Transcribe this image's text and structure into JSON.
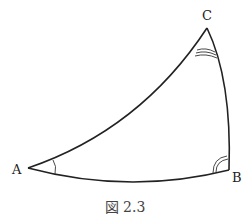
{
  "figure": {
    "caption": "図 2.3",
    "vertices": {
      "A": {
        "label": "A",
        "x": 28,
        "y": 168
      },
      "B": {
        "label": "B",
        "x": 229,
        "y": 170
      },
      "C": {
        "label": "C",
        "x": 207,
        "y": 28
      }
    },
    "angle_marks": {
      "A": 1,
      "B": 2,
      "C": 3
    },
    "stroke_color": "#222222"
  }
}
